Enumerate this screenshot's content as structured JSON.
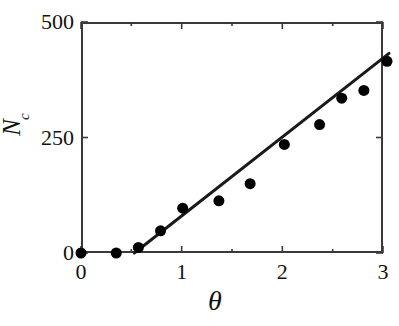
{
  "figure": {
    "caption_top_sliver": "",
    "caption_bottom_sliver": ""
  },
  "axes": {
    "xlabel": "θ",
    "ylabel_symbol": "N",
    "ylabel_subscript": "c",
    "xticks": [
      "0",
      "1",
      "2",
      "3"
    ],
    "yticks": [
      "0",
      "250",
      "500"
    ]
  },
  "chart_data": {
    "type": "scatter",
    "title": "",
    "xlabel": "θ",
    "ylabel": "N_c",
    "xlim": [
      0,
      3
    ],
    "ylim": [
      0,
      500
    ],
    "xticks": [
      0,
      1,
      2,
      3
    ],
    "yticks": [
      0,
      250,
      500
    ],
    "xminorticks": [
      0.5,
      1.5,
      2.5
    ],
    "grid": false,
    "legend": null,
    "frame": "box",
    "tick_direction": "in",
    "marker": {
      "shape": "circle",
      "filled": true,
      "color": "#000000",
      "size_px": 11
    },
    "series": [
      {
        "name": "data",
        "type": "scatter",
        "points": [
          {
            "x": 0.0,
            "y": 0
          },
          {
            "x": 0.35,
            "y": 0
          },
          {
            "x": 0.57,
            "y": 12
          },
          {
            "x": 0.79,
            "y": 48
          },
          {
            "x": 1.01,
            "y": 97
          },
          {
            "x": 1.37,
            "y": 113
          },
          {
            "x": 1.68,
            "y": 150
          },
          {
            "x": 2.02,
            "y": 235
          },
          {
            "x": 2.37,
            "y": 278
          },
          {
            "x": 2.59,
            "y": 335
          },
          {
            "x": 2.81,
            "y": 352
          },
          {
            "x": 3.04,
            "y": 415
          }
        ]
      },
      {
        "name": "linear fit",
        "type": "line",
        "color": "#1a1a1a",
        "width_px": 3,
        "points": [
          {
            "x": 0.53,
            "y": 0
          },
          {
            "x": 3.06,
            "y": 432
          }
        ]
      }
    ]
  }
}
